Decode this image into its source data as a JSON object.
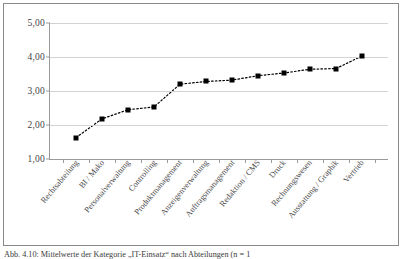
{
  "caption": {
    "text": "Abb. 4.10: Mittelwerte der Kategorie „IT-Einsatz“ nach Abteilungen (n = 1"
  },
  "chart_data": {
    "type": "line",
    "title": "",
    "xlabel": "",
    "ylabel": "",
    "ylim": [
      1,
      5
    ],
    "yticks": [
      1,
      2,
      3,
      4,
      5
    ],
    "ytick_labels": [
      "1,00",
      "2,00",
      "3,00",
      "4,00",
      "5,00"
    ],
    "grid": true,
    "legend": "none",
    "marker": "square",
    "marker_color": "#000000",
    "line_style": "dotted",
    "categories": [
      "Rechtsabteilung",
      "BI / Mako",
      "Personalverwaltung",
      "Controlling",
      "Produktmanagement",
      "Anzeigenverwaltung",
      "Auftragsmanagement",
      "Redaktion / CMS",
      "Druck",
      "Rechnungswesen",
      "Ausstattung / Graphik",
      "Vertrieb"
    ],
    "values": [
      1.63,
      2.18,
      2.45,
      2.53,
      3.2,
      3.28,
      3.32,
      3.45,
      3.53,
      3.64,
      3.66,
      4.03
    ]
  }
}
